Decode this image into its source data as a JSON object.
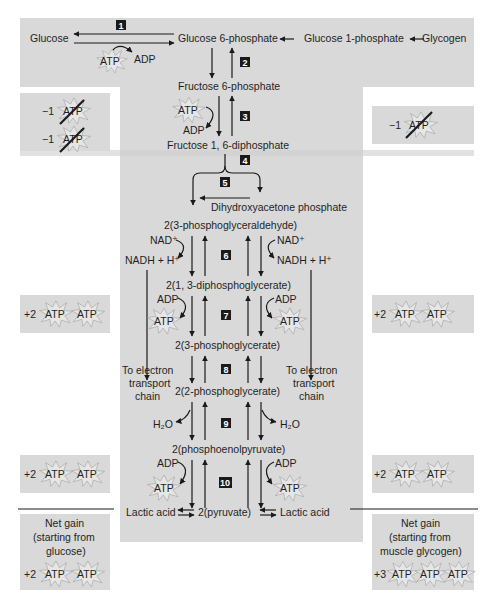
{
  "diagram": {
    "colors": {
      "panel_gray": "#d9d9d9",
      "background": "#ffffff",
      "arrow": "#1a1a1a",
      "step_badge": "#1a1a1a",
      "atp_star_fill": "#e6e6e6",
      "atp_star_stroke": "#a8a8a8"
    },
    "top_row": {
      "glucose": "Glucose",
      "glucose_6_phosphate": "Glucose 6-phosphate",
      "glucose_1_phosphate": "Glucose 1-phosphate",
      "glycogen": "Glycogen",
      "atp": "ATP",
      "adp": "ADP"
    },
    "steps": [
      "1",
      "2",
      "3",
      "4",
      "5",
      "6",
      "7",
      "8",
      "9",
      "10"
    ],
    "metabolites": {
      "fructose_6_phosphate": "Fructose 6-phosphate",
      "fructose_1_6_diphosphate": "Fructose 1, 6-diphosphate",
      "dihydroxyacetone_phosphate": "Dihydroxyacetone phosphate",
      "phosphoglyceraldehyde": "2(3-phosphoglyceraldehyde)",
      "diphosphoglycerate": "2(1, 3-diphosphoglycerate)",
      "phosphoglycerate_3": "2(3-phosphoglycerate)",
      "phosphoglycerate_2": "2(2-phosphoglycerate)",
      "phosphoenolpyruvate": "2(phosphoenolpyruvate)",
      "pyruvate": "2(pyruvate)",
      "lactic_acid_left": "Lactic acid",
      "lactic_acid_right": "Lactic acid"
    },
    "cofactors": {
      "atp": "ATP",
      "adp": "ADP",
      "nad_plus": "NAD⁺",
      "nadh": "NADH + H⁺",
      "h2o": "H₂O"
    },
    "electron_transport": {
      "line1": "To electron",
      "line2": "transport",
      "line3": "chain"
    },
    "side_boxes": {
      "left_cost": {
        "row1_amount": "−1",
        "row1_label": "ATP",
        "row2_amount": "−1",
        "row2_label": "ATP"
      },
      "right_cost": {
        "amount": "−1",
        "label": "ATP"
      },
      "left_gain_step7": {
        "amount": "+2",
        "labels": [
          "ATP",
          "ATP"
        ]
      },
      "right_gain_step7": {
        "amount": "+2",
        "labels": [
          "ATP",
          "ATP"
        ]
      },
      "left_gain_step10": {
        "amount": "+2",
        "labels": [
          "ATP",
          "ATP"
        ]
      },
      "right_gain_step10": {
        "amount": "+2",
        "labels": [
          "ATP",
          "ATP"
        ]
      },
      "net_gain_glucose": {
        "line1": "Net gain",
        "line2": "(starting from",
        "line3": "glucose)",
        "amount": "+2",
        "labels": [
          "ATP",
          "ATP"
        ]
      },
      "net_gain_glycogen": {
        "line1": "Net gain",
        "line2": "(starting from",
        "line3": "muscle glycogen)",
        "amount": "+3",
        "labels": [
          "ATP",
          "ATP",
          "ATP"
        ]
      }
    }
  }
}
